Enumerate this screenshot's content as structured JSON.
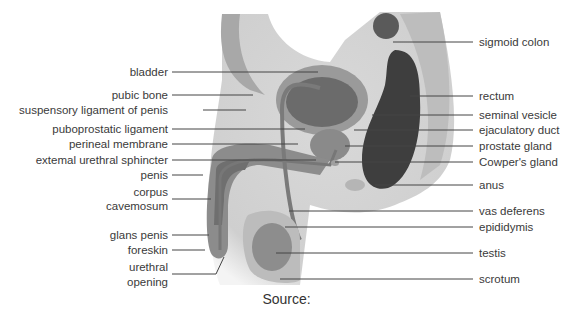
{
  "diagram": {
    "left_labels": [
      {
        "text": "bladder",
        "y": 72
      },
      {
        "text": "pubic bone",
        "y": 95
      },
      {
        "text": "suspensory ligament of penis",
        "y": 110
      },
      {
        "text": "puboprostatic ligament",
        "y": 129
      },
      {
        "text": "perineal membrane",
        "y": 144
      },
      {
        "text": "extemal urethral sphincter",
        "y": 160
      },
      {
        "text": "penis",
        "y": 175
      },
      {
        "text": "corpus",
        "y": 192
      },
      {
        "text": "cavemosum",
        "y": 206
      },
      {
        "text": "glans penis",
        "y": 235
      },
      {
        "text": "foreskin",
        "y": 250
      },
      {
        "text": "urethral",
        "y": 267
      },
      {
        "text": "opening",
        "y": 282
      }
    ],
    "right_labels": [
      {
        "text": "sigmoid colon",
        "y": 42
      },
      {
        "text": "rectum",
        "y": 96
      },
      {
        "text": "seminal vesicle",
        "y": 115
      },
      {
        "text": "ejaculatory duct",
        "y": 130
      },
      {
        "text": "prostate gland",
        "y": 146
      },
      {
        "text": "Cowper's gland",
        "y": 162
      },
      {
        "text": "anus",
        "y": 185
      },
      {
        "text": "vas deferens",
        "y": 211
      },
      {
        "text": "epididymis",
        "y": 227
      },
      {
        "text": "testis",
        "y": 253
      },
      {
        "text": "scrotum",
        "y": 279
      }
    ],
    "source_label": "Source:"
  }
}
